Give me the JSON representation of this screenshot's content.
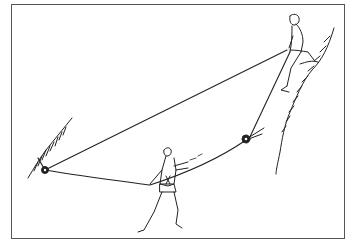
{
  "illustration": {
    "subject": "rope-rescue-tyrolean-setup",
    "alt": "Line drawing: a climber seated on a ledge at upper right belays a rope running down to a pulley anchor on the left rock face and to a second pulley on the right rock face; a climber standing at the bottom center hauls on the rope.",
    "colors": {
      "ink": "#222222",
      "frame": "#555555",
      "background": "#ffffff"
    },
    "elements": [
      "frame",
      "left-rock-face",
      "right-cliff",
      "seated-climber",
      "standing-climber",
      "left-pulley",
      "right-pulley",
      "main-rope",
      "haul-rope"
    ]
  }
}
